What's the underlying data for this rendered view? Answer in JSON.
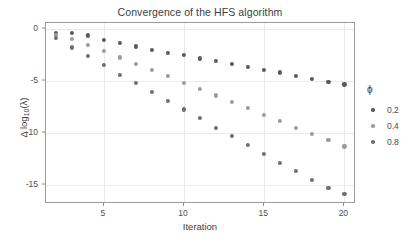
{
  "chart_data": {
    "type": "scatter",
    "title": "Convergence of the HFS algorithm",
    "xlabel": "Iteration",
    "ylabel": "Δ log10(λ)",
    "ylabel_parts": {
      "delta": "Δ",
      "log": "log",
      "sub": "10",
      "arg": "(λ)"
    },
    "xlim": [
      1.4,
      20.6
    ],
    "ylim": [
      -16.6,
      0.6
    ],
    "xticks": [
      5,
      10,
      15,
      20
    ],
    "yticks": [
      0,
      -5,
      -10,
      -15
    ],
    "xtick_labels": [
      "5",
      "10",
      "15",
      "20"
    ],
    "ytick_labels": [
      "0",
      "-5",
      "-10",
      "-15"
    ],
    "grid": true,
    "legend": {
      "title": "ϕ",
      "position": "right",
      "entries": [
        {
          "label": "0.2",
          "color": "#595959"
        },
        {
          "label": "0.4",
          "color": "#9c9c9c"
        },
        {
          "label": "0.8",
          "color": "#6e6e6e"
        }
      ]
    },
    "x": [
      2,
      3,
      4,
      5,
      6,
      7,
      8,
      9,
      10,
      11,
      12,
      13,
      14,
      15,
      16,
      17,
      18,
      19,
      20
    ],
    "series": [
      {
        "name": "0.2",
        "color": "#595959",
        "values": [
          -0.35,
          -0.35,
          -0.6,
          -1.0,
          -1.35,
          -1.65,
          -1.95,
          -2.25,
          -2.5,
          -2.8,
          -3.05,
          -3.35,
          -3.6,
          -3.9,
          -4.15,
          -4.45,
          -4.75,
          -5.05,
          -5.3
        ]
      },
      {
        "name": "0.4",
        "color": "#9c9c9c",
        "values": [
          -0.55,
          -0.95,
          -1.5,
          -2.05,
          -2.7,
          -3.3,
          -3.9,
          -4.5,
          -5.15,
          -5.7,
          -6.35,
          -6.95,
          -7.55,
          -8.2,
          -8.8,
          -9.45,
          -10.05,
          -10.6,
          -11.25
        ]
      },
      {
        "name": "0.8",
        "color": "#6e6e6e",
        "values": [
          -0.8,
          -1.75,
          -2.6,
          -3.45,
          -4.35,
          -5.15,
          -6.0,
          -6.85,
          -7.7,
          -8.55,
          -9.45,
          -10.25,
          -11.1,
          -11.95,
          -12.85,
          -13.65,
          -14.5,
          -15.25,
          -15.85
        ]
      }
    ]
  }
}
